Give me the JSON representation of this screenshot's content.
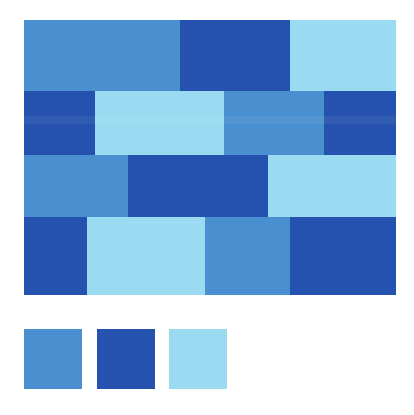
{
  "palette": {
    "medium_blue": "#4a8fcf",
    "dark_blue": "#2552ae",
    "light_blue": "#9bdbf2"
  },
  "pattern": {
    "rows": [
      {
        "y": 20,
        "h": 71,
        "bricks": [
          {
            "x": 24,
            "w": 156,
            "color": "medium_blue"
          },
          {
            "x": 180,
            "w": 110,
            "color": "dark_blue"
          },
          {
            "x": 290,
            "w": 106,
            "color": "light_blue"
          }
        ]
      },
      {
        "y": 91,
        "h": 64,
        "bricks": [
          {
            "x": 24,
            "w": 71,
            "color": "dark_blue"
          },
          {
            "x": 95,
            "w": 129,
            "color": "light_blue"
          },
          {
            "x": 224,
            "w": 100,
            "color": "medium_blue"
          },
          {
            "x": 324,
            "w": 72,
            "color": "dark_blue"
          }
        ]
      },
      {
        "y": 155,
        "h": 62,
        "bricks": [
          {
            "x": 24,
            "w": 104,
            "color": "medium_blue"
          },
          {
            "x": 128,
            "w": 140,
            "color": "dark_blue"
          },
          {
            "x": 268,
            "w": 128,
            "color": "light_blue"
          }
        ]
      },
      {
        "y": 217,
        "h": 78,
        "bricks": [
          {
            "x": 24,
            "w": 63,
            "color": "dark_blue"
          },
          {
            "x": 87,
            "w": 118,
            "color": "light_blue"
          },
          {
            "x": 205,
            "w": 85,
            "color": "medium_blue"
          },
          {
            "x": 290,
            "w": 106,
            "color": "dark_blue"
          }
        ]
      }
    ]
  },
  "swatches": [
    {
      "x": 24,
      "color": "medium_blue"
    },
    {
      "x": 97,
      "color": "dark_blue"
    },
    {
      "x": 169,
      "color": "light_blue"
    }
  ]
}
